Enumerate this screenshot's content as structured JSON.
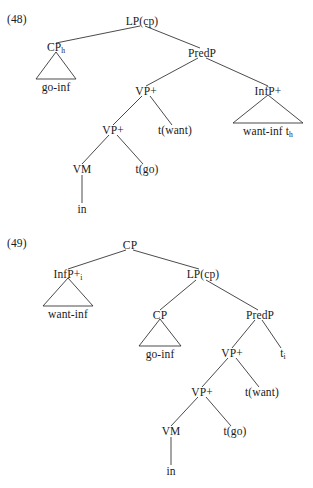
{
  "document": {
    "type": "syntax-tree-figure-set",
    "background_color": "#ffffff",
    "text_color": "#1a1a1a",
    "line_color": "#2b2b2b"
  },
  "figures": [
    {
      "id": "48",
      "number_label": "(48)",
      "root": "LP(cp)",
      "nodes": [
        {
          "key": "lp_cp",
          "label": "LP(cp)",
          "sub": ""
        },
        {
          "key": "cp_h",
          "label": "CP",
          "sub": "h"
        },
        {
          "key": "predp",
          "label": "PredP",
          "sub": ""
        },
        {
          "key": "vp_plus1",
          "label": "VP+",
          "sub": ""
        },
        {
          "key": "infp",
          "label": "InfP+",
          "sub": ""
        },
        {
          "key": "vp_plus2",
          "label": "VP+",
          "sub": ""
        },
        {
          "key": "t_want",
          "label": "t(want)",
          "sub": ""
        },
        {
          "key": "vm",
          "label": "VM",
          "sub": ""
        },
        {
          "key": "t_go",
          "label": "t(go)",
          "sub": ""
        }
      ],
      "leaves": [
        {
          "key": "go_inf",
          "label": "go-inf",
          "sub": "",
          "under_triangle": true
        },
        {
          "key": "want_inf_t",
          "label": "want-inf t",
          "sub": "h",
          "under_triangle": true
        },
        {
          "key": "in",
          "label": "in",
          "sub": "",
          "under_triangle": false
        }
      ]
    },
    {
      "id": "49",
      "number_label": "(49)",
      "root": "CP",
      "nodes": [
        {
          "key": "cp_root",
          "label": "CP",
          "sub": ""
        },
        {
          "key": "infp_i",
          "label": "InfP+",
          "sub": "i"
        },
        {
          "key": "lp_cp",
          "label": "LP(cp)",
          "sub": ""
        },
        {
          "key": "cp_inner",
          "label": "CP",
          "sub": ""
        },
        {
          "key": "predp",
          "label": "PredP",
          "sub": ""
        },
        {
          "key": "vp_plus1",
          "label": "VP+",
          "sub": ""
        },
        {
          "key": "t_i",
          "label": "t",
          "sub": "i"
        },
        {
          "key": "vp_plus2",
          "label": "VP+",
          "sub": ""
        },
        {
          "key": "t_want",
          "label": "t(want)",
          "sub": ""
        },
        {
          "key": "vm",
          "label": "VM",
          "sub": ""
        },
        {
          "key": "t_go",
          "label": "t(go)",
          "sub": ""
        }
      ],
      "leaves": [
        {
          "key": "want_inf",
          "label": "want-inf",
          "sub": "",
          "under_triangle": true
        },
        {
          "key": "go_inf",
          "label": "go-inf",
          "sub": "",
          "under_triangle": true
        },
        {
          "key": "in",
          "label": "in",
          "sub": "",
          "under_triangle": false
        }
      ]
    }
  ]
}
